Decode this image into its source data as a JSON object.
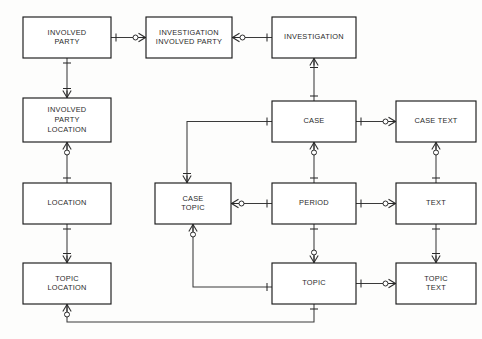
{
  "diagram": {
    "notation": "crow's foot (IE) notation",
    "canvas": {
      "width": 482,
      "height": 339
    },
    "stroke_color": "#1b1b1b",
    "line_color": "#3a3a3a",
    "background_color": "#fdfdfc",
    "entities": [
      {
        "id": "involved-party",
        "label": "INVOLVED\nPARTY",
        "lines": [
          "INVOLVED",
          "PARTY"
        ],
        "x": 23,
        "y": 17,
        "w": 88,
        "h": 41
      },
      {
        "id": "investigation-involved-party",
        "label": "INVESTIGATION\nINVOLVED PARTY",
        "lines": [
          "INVESTIGATION",
          "INVOLVED PARTY"
        ],
        "x": 146,
        "y": 17,
        "w": 86,
        "h": 41
      },
      {
        "id": "investigation",
        "label": "INVESTIGATION",
        "lines": [
          "INVESTIGATION"
        ],
        "x": 272,
        "y": 17,
        "w": 84,
        "h": 41
      },
      {
        "id": "involved-party-location",
        "label": "INVOLVED\nPARTY\nLOCATION",
        "lines": [
          "INVOLVED",
          "PARTY",
          "LOCATION"
        ],
        "x": 23,
        "y": 98,
        "w": 88,
        "h": 44
      },
      {
        "id": "case",
        "label": "CASE",
        "lines": [
          "CASE"
        ],
        "x": 272,
        "y": 101,
        "w": 84,
        "h": 41
      },
      {
        "id": "case-text",
        "label": "CASE TEXT",
        "lines": [
          "CASE TEXT"
        ],
        "x": 396,
        "y": 101,
        "w": 80,
        "h": 41
      },
      {
        "id": "location",
        "label": "LOCATION",
        "lines": [
          "LOCATION"
        ],
        "x": 23,
        "y": 183,
        "w": 88,
        "h": 41
      },
      {
        "id": "case-topic",
        "label": "CASE\nTOPIC",
        "lines": [
          "CASE",
          "TOPIC"
        ],
        "x": 155,
        "y": 183,
        "w": 76,
        "h": 41
      },
      {
        "id": "period",
        "label": "PERIOD",
        "lines": [
          "PERIOD"
        ],
        "x": 272,
        "y": 183,
        "w": 84,
        "h": 41
      },
      {
        "id": "text",
        "label": "TEXT",
        "lines": [
          "TEXT"
        ],
        "x": 396,
        "y": 183,
        "w": 80,
        "h": 41
      },
      {
        "id": "topic-location",
        "label": "TOPIC\nLOCATION",
        "lines": [
          "TOPIC",
          "LOCATION"
        ],
        "x": 23,
        "y": 263,
        "w": 88,
        "h": 41
      },
      {
        "id": "topic",
        "label": "TOPIC",
        "lines": [
          "TOPIC"
        ],
        "x": 272,
        "y": 263,
        "w": 84,
        "h": 41
      },
      {
        "id": "topic-text",
        "label": "TOPIC\nTEXT",
        "lines": [
          "TOPIC",
          "TEXT"
        ],
        "x": 396,
        "y": 263,
        "w": 80,
        "h": 41
      }
    ],
    "relationships": [
      {
        "id": "rel-ip-iip",
        "from": "involved-party",
        "to": "investigation-involved-party",
        "from_card": "one",
        "to_card": "zero-or-many"
      },
      {
        "id": "rel-iip-inv",
        "from": "investigation-involved-party",
        "to": "investigation",
        "from_card": "zero-or-many",
        "to_card": "one"
      },
      {
        "id": "rel-ip-ipl",
        "from": "involved-party",
        "to": "involved-party-location",
        "from_card": "one",
        "to_card": "many"
      },
      {
        "id": "rel-inv-case",
        "from": "investigation",
        "to": "case",
        "from_card": "many",
        "to_card": "one"
      },
      {
        "id": "rel-case-casetext",
        "from": "case",
        "to": "case-text",
        "from_card": "one",
        "to_card": "zero-or-many"
      },
      {
        "id": "rel-ipl-loc",
        "from": "involved-party-location",
        "to": "location",
        "from_card": "zero-or-many",
        "to_card": "one"
      },
      {
        "id": "rel-case-period",
        "from": "case",
        "to": "period",
        "from_card": "zero-or-many",
        "to_card": "one"
      },
      {
        "id": "rel-casetext-text",
        "from": "case-text",
        "to": "text",
        "from_card": "zero-or-many",
        "to_card": "one"
      },
      {
        "id": "rel-case-casetopic",
        "from": "case",
        "to": "case-topic",
        "from_card": "one",
        "to_card": "many"
      },
      {
        "id": "rel-casetopic-period",
        "from": "case-topic",
        "to": "period",
        "from_card": "zero-or-many",
        "to_card": "one"
      },
      {
        "id": "rel-period-text",
        "from": "period",
        "to": "text",
        "from_card": "one",
        "to_card": "zero-or-many"
      },
      {
        "id": "rel-loc-toploc",
        "from": "location",
        "to": "topic-location",
        "from_card": "one",
        "to_card": "many"
      },
      {
        "id": "rel-casetopic-topic",
        "from": "case-topic",
        "to": "topic",
        "from_card": "zero-or-many",
        "to_card": "one"
      },
      {
        "id": "rel-period-topic",
        "from": "period",
        "to": "topic",
        "from_card": "one",
        "to_card": "zero-or-many"
      },
      {
        "id": "rel-text-topictext",
        "from": "text",
        "to": "topic-text",
        "from_card": "one",
        "to_card": "many"
      },
      {
        "id": "rel-topic-topictext",
        "from": "topic",
        "to": "topic-text",
        "from_card": "one",
        "to_card": "zero-or-many"
      },
      {
        "id": "rel-toploc-topic",
        "from": "topic-location",
        "to": "topic",
        "from_card": "zero-or-many",
        "to_card": "one"
      }
    ]
  }
}
